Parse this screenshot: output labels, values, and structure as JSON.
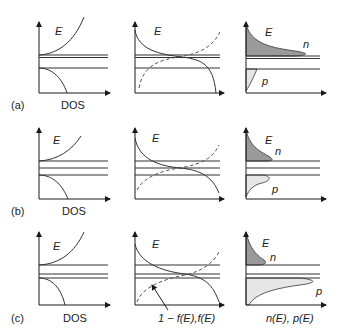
{
  "figure": {
    "rows": [
      {
        "id": "a",
        "tag": "(a)",
        "description": "intrinsic"
      },
      {
        "id": "b",
        "tag": "(b)",
        "description": "n-type"
      },
      {
        "id": "c",
        "tag": "(c)",
        "description": "p-type"
      }
    ],
    "columns": [
      {
        "id": "dos",
        "xlabel": "DOS"
      },
      {
        "id": "fermi",
        "xlabel": "1 − f(E), f(E)"
      },
      {
        "id": "carriers",
        "xlabel": "n(E), p(E)"
      }
    ],
    "labels": {
      "energy": "E",
      "electrons": "n",
      "holes": "p",
      "row_a": "(a)",
      "row_b": "(b)",
      "row_c": "(c)",
      "dos": "DOS",
      "fermi_axis": "1 − f(E),f(E)",
      "carrier_axis": "n(E), p(E)"
    },
    "colors": {
      "line": "#333333",
      "electron_fill": "#9a9a9a",
      "hole_fill": "#e6e6e6",
      "background": "#ffffff"
    }
  }
}
